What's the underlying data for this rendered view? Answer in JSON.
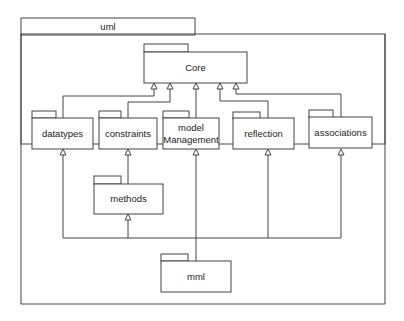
{
  "diagram": {
    "type": "UML package diagram",
    "container": {
      "name": "uml"
    },
    "packages": {
      "core": {
        "name": "Core"
      },
      "datatypes": {
        "name": "datatypes"
      },
      "constraints": {
        "name": "constraints"
      },
      "model_management": {
        "line1": "model",
        "line2": "Management"
      },
      "reflection": {
        "name": "reflection"
      },
      "associations": {
        "name": "associations"
      },
      "methods": {
        "name": "methods"
      },
      "mml": {
        "name": "mml"
      }
    },
    "dependencies": [
      {
        "from": "datatypes",
        "to": "Core"
      },
      {
        "from": "constraints",
        "to": "Core"
      },
      {
        "from": "model Management",
        "to": "Core"
      },
      {
        "from": "reflection",
        "to": "Core"
      },
      {
        "from": "associations",
        "to": "Core"
      },
      {
        "from": "methods",
        "to": "constraints"
      },
      {
        "from": "mml",
        "to": "datatypes"
      },
      {
        "from": "mml",
        "to": "methods"
      },
      {
        "from": "mml",
        "to": "model Management"
      },
      {
        "from": "mml",
        "to": "reflection"
      },
      {
        "from": "mml",
        "to": "associations"
      }
    ]
  }
}
